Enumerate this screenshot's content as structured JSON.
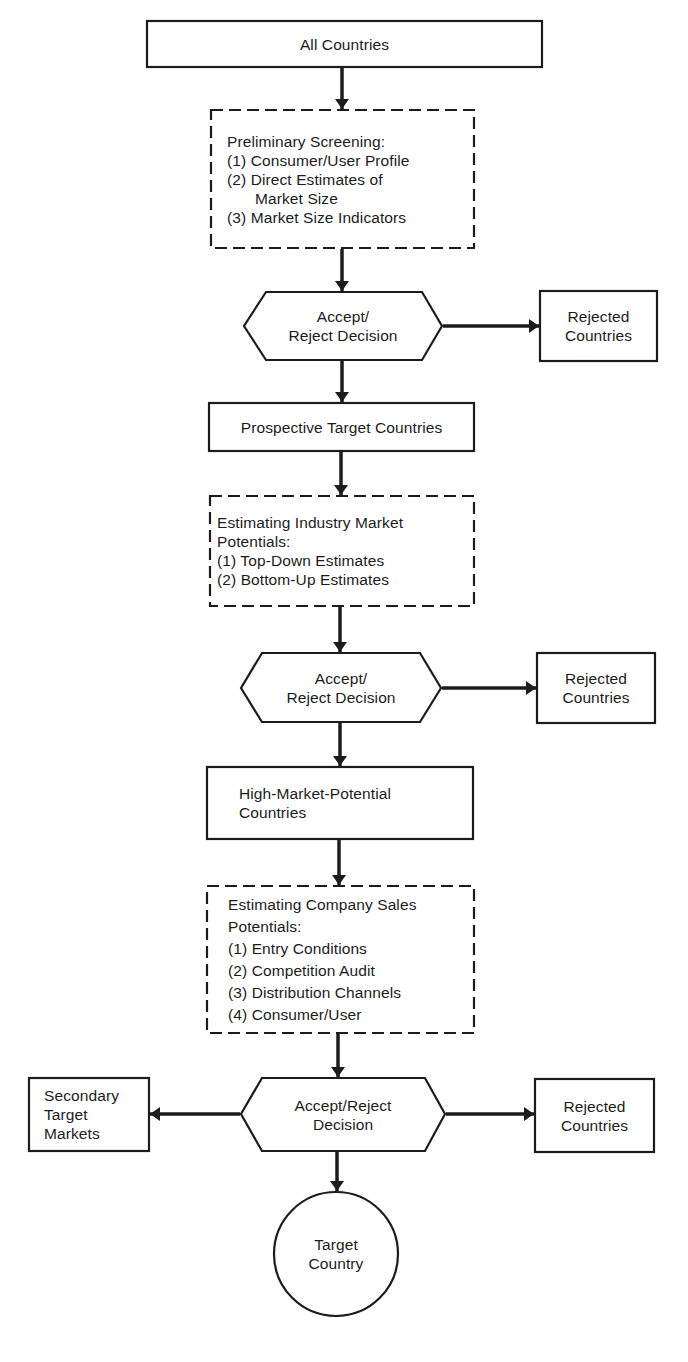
{
  "diagram": {
    "colors": {
      "stroke": "#1c1c1c",
      "background": "#ffffff",
      "text": "#1c1c1c"
    },
    "nodes": {
      "all_countries": {
        "shape": "rectangle",
        "lines": [
          "All Countries"
        ]
      },
      "preliminary_screening": {
        "shape": "dashed-rectangle",
        "lines": [
          "Preliminary Screening:",
          "(1) Consumer/User Profile",
          "(2) Direct Estimates of",
          "Market Size",
          "(3) Market Size Indicators"
        ]
      },
      "decision_1": {
        "shape": "hexagon",
        "lines": [
          "Accept/",
          "Reject Decision"
        ]
      },
      "rejected_1": {
        "shape": "rectangle",
        "lines": [
          "Rejected",
          "Countries"
        ]
      },
      "prospective_targets": {
        "shape": "rectangle",
        "lines": [
          "Prospective Target Countries"
        ]
      },
      "industry_potentials": {
        "shape": "dashed-rectangle",
        "lines": [
          "Estimating Industry Market",
          "Potentials:",
          "(1) Top-Down Estimates",
          "(2) Bottom-Up Estimates"
        ]
      },
      "decision_2": {
        "shape": "hexagon",
        "lines": [
          "Accept/",
          "Reject Decision"
        ]
      },
      "rejected_2": {
        "shape": "rectangle",
        "lines": [
          "Rejected",
          "Countries"
        ]
      },
      "high_potential": {
        "shape": "rectangle",
        "lines": [
          "High-Market-Potential",
          "Countries"
        ]
      },
      "company_sales": {
        "shape": "dashed-rectangle",
        "lines": [
          "Estimating Company Sales",
          "Potentials:",
          "(1) Entry Conditions",
          "(2) Competition Audit",
          "(3) Distribution Channels",
          "(4) Consumer/User"
        ]
      },
      "decision_3": {
        "shape": "hexagon",
        "lines": [
          "Accept/Reject",
          "Decision"
        ]
      },
      "secondary_targets": {
        "shape": "rectangle",
        "lines": [
          "Secondary",
          "Target",
          "Markets"
        ]
      },
      "rejected_3": {
        "shape": "rectangle",
        "lines": [
          "Rejected",
          "Countries"
        ]
      },
      "target_country": {
        "shape": "circle",
        "lines": [
          "Target",
          "Country"
        ]
      }
    },
    "edges": [
      {
        "from": "all_countries",
        "to": "preliminary_screening"
      },
      {
        "from": "preliminary_screening",
        "to": "decision_1"
      },
      {
        "from": "decision_1",
        "to": "rejected_1"
      },
      {
        "from": "decision_1",
        "to": "prospective_targets"
      },
      {
        "from": "prospective_targets",
        "to": "industry_potentials"
      },
      {
        "from": "industry_potentials",
        "to": "decision_2"
      },
      {
        "from": "decision_2",
        "to": "rejected_2"
      },
      {
        "from": "decision_2",
        "to": "high_potential"
      },
      {
        "from": "high_potential",
        "to": "company_sales"
      },
      {
        "from": "company_sales",
        "to": "decision_3"
      },
      {
        "from": "decision_3",
        "to": "secondary_targets"
      },
      {
        "from": "decision_3",
        "to": "rejected_3"
      },
      {
        "from": "decision_3",
        "to": "target_country"
      }
    ]
  }
}
